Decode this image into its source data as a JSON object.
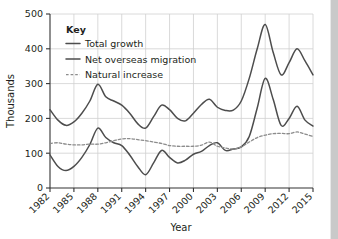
{
  "chart_data": {
    "type": "line",
    "title": "",
    "xlabel": "Year",
    "ylabel": "Thousands",
    "xlim": [
      1982,
      2015
    ],
    "ylim": [
      0,
      500
    ],
    "grid": true,
    "legend_position": "top-left-inside",
    "legend_title": "Key",
    "xticks": [
      "1982",
      "1985",
      "1988",
      "1991",
      "1994",
      "1997",
      "2000",
      "2003",
      "2006",
      "2009",
      "2012",
      "2015"
    ],
    "yticks": [
      "0",
      "100",
      "200",
      "300",
      "400",
      "500"
    ],
    "x": [
      1982,
      1983,
      1984,
      1985,
      1986,
      1987,
      1988,
      1989,
      1990,
      1991,
      1992,
      1993,
      1994,
      1995,
      1996,
      1997,
      1998,
      1999,
      2000,
      2001,
      2002,
      2003,
      2004,
      2005,
      2006,
      2007,
      2008,
      2009,
      2010,
      2011,
      2012,
      2013,
      2014,
      2015
    ],
    "series": [
      {
        "name": "Total growth",
        "style": "solid",
        "color": "#4d4d4d",
        "values": [
          225,
          195,
          180,
          190,
          215,
          250,
          298,
          262,
          250,
          238,
          215,
          185,
          172,
          205,
          238,
          225,
          200,
          193,
          215,
          240,
          255,
          232,
          223,
          224,
          250,
          315,
          400,
          470,
          390,
          325,
          360,
          400,
          365,
          325
        ]
      },
      {
        "name": "Net overseas migration",
        "style": "solid",
        "color": "#4d4d4d",
        "values": [
          95,
          62,
          50,
          62,
          88,
          125,
          172,
          145,
          130,
          122,
          95,
          62,
          38,
          72,
          108,
          88,
          72,
          80,
          97,
          105,
          122,
          130,
          108,
          112,
          118,
          148,
          230,
          315,
          255,
          180,
          200,
          235,
          195,
          178
        ]
      },
      {
        "name": "Natural increase",
        "style": "dashed",
        "color": "#8c8c8c",
        "values": [
          128,
          130,
          126,
          124,
          124,
          126,
          126,
          130,
          136,
          141,
          142,
          139,
          136,
          132,
          128,
          122,
          120,
          120,
          120,
          123,
          132,
          120,
          115,
          112,
          118,
          132,
          145,
          152,
          156,
          157,
          156,
          161,
          155,
          148
        ]
      }
    ]
  },
  "legend": {
    "title": "Key",
    "items": [
      {
        "label": "Total growth",
        "style": "solid"
      },
      {
        "label": "Net overseas migration",
        "style": "solid"
      },
      {
        "label": "Natural increase",
        "style": "dashed"
      }
    ]
  },
  "axes": {
    "y_title": "Thousands",
    "x_title": "Year"
  },
  "colors": {
    "total_growth": "#4d4d4d",
    "net_overseas_migration": "#4d4d4d",
    "natural_increase": "#8c8c8c",
    "grid": "#d0d0d0",
    "axis": "#333333",
    "text": "#231f20"
  }
}
